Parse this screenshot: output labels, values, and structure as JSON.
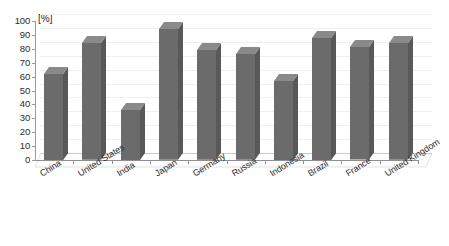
{
  "chart_data": {
    "type": "bar",
    "title": "",
    "subtitle": "",
    "xlabel": "",
    "ylabel": "[%]",
    "unit_label": "[%]",
    "ylim": [
      0,
      100
    ],
    "y_ticks": [
      0,
      10,
      20,
      30,
      40,
      50,
      60,
      70,
      80,
      90,
      100
    ],
    "y_tick_labels": [
      "0",
      "10",
      "20",
      "30",
      "40",
      "50",
      "60",
      "70",
      "80",
      "90",
      "100"
    ],
    "grid": true,
    "legend": false,
    "legend_position": "none",
    "bar_style": "3d-column",
    "bar_color": "#6b6b6b",
    "bar_side_color": "#585858",
    "bar_top_color": "#8a8a8a",
    "gridline_color": "#efefef",
    "axis_color": "#8f8f8f",
    "categories": [
      "China",
      "United States",
      "India",
      "Japan",
      "Germany",
      "Russia",
      "Indonesia",
      "Brazil",
      "France",
      "United Kingdom"
    ],
    "values": [
      62,
      84,
      36,
      94,
      79,
      76,
      57,
      88,
      81,
      84
    ],
    "series": [
      {
        "name": "",
        "values": [
          62,
          84,
          36,
          94,
          79,
          76,
          57,
          88,
          81,
          84
        ]
      }
    ],
    "annotations": []
  }
}
